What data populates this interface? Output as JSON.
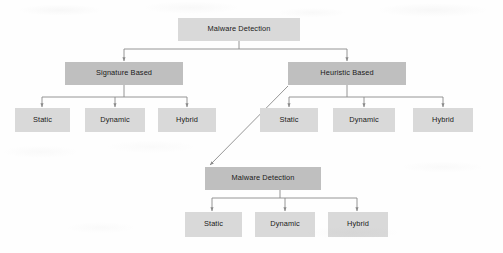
{
  "diagram": {
    "colors": {
      "node_light": "#d9d9d9",
      "node_dark": "#bfbfbf",
      "edge": "#808080",
      "text": "#1a1a1a",
      "background": "#fefefe"
    },
    "nodes": [
      {
        "id": "root",
        "label": "Malware Detection",
        "shade": "light",
        "x": 178,
        "y": 18,
        "w": 122,
        "h": 23
      },
      {
        "id": "signature",
        "label": "Signature Based",
        "shade": "dark",
        "x": 65,
        "y": 62,
        "w": 118,
        "h": 23
      },
      {
        "id": "heuristic",
        "label": "Heuristic Based",
        "shade": "dark",
        "x": 288,
        "y": 62,
        "w": 118,
        "h": 23
      },
      {
        "id": "sig-static",
        "label": "Static",
        "shade": "light",
        "x": 15,
        "y": 108,
        "w": 55,
        "h": 24
      },
      {
        "id": "sig-dynamic",
        "label": "Dynamic",
        "shade": "light",
        "x": 85,
        "y": 108,
        "w": 60,
        "h": 24
      },
      {
        "id": "sig-hybrid",
        "label": "Hybrid",
        "shade": "light",
        "x": 158,
        "y": 108,
        "w": 58,
        "h": 24
      },
      {
        "id": "heu-static",
        "label": "Static",
        "shade": "light",
        "x": 260,
        "y": 108,
        "w": 58,
        "h": 24
      },
      {
        "id": "heu-dynamic",
        "label": "Dynamic",
        "shade": "light",
        "x": 333,
        "y": 108,
        "w": 62,
        "h": 24
      },
      {
        "id": "heu-hybrid",
        "label": "Hybrid",
        "shade": "light",
        "x": 413,
        "y": 108,
        "w": 60,
        "h": 24
      },
      {
        "id": "root2",
        "label": "Malware Detection",
        "shade": "dark",
        "x": 205,
        "y": 167,
        "w": 116,
        "h": 23
      },
      {
        "id": "b-static",
        "label": "Static",
        "shade": "light",
        "x": 185,
        "y": 212,
        "w": 57,
        "h": 25
      },
      {
        "id": "b-dynamic",
        "label": "Dynamic",
        "shade": "light",
        "x": 255,
        "y": 212,
        "w": 60,
        "h": 25
      },
      {
        "id": "b-hybrid",
        "label": "Hybrid",
        "shade": "light",
        "x": 328,
        "y": 212,
        "w": 60,
        "h": 25
      }
    ],
    "edges": [
      {
        "id": "root-to-signature",
        "from": "root",
        "to": "signature",
        "style": "elbow"
      },
      {
        "id": "root-to-heuristic",
        "from": "root",
        "to": "heuristic",
        "style": "elbow"
      },
      {
        "id": "sig-to-static",
        "from": "signature",
        "to": "sig-static",
        "style": "elbow"
      },
      {
        "id": "sig-to-dynamic",
        "from": "signature",
        "to": "sig-dynamic",
        "style": "straight"
      },
      {
        "id": "sig-to-hybrid",
        "from": "signature",
        "to": "sig-hybrid",
        "style": "elbow"
      },
      {
        "id": "heu-to-static",
        "from": "heuristic",
        "to": "heu-static",
        "style": "elbow"
      },
      {
        "id": "heu-to-dynamic",
        "from": "heuristic",
        "to": "heu-dynamic",
        "style": "straight"
      },
      {
        "id": "heu-to-hybrid",
        "from": "heuristic",
        "to": "heu-hybrid",
        "style": "elbow"
      },
      {
        "id": "heu-to-root2",
        "from": "heuristic",
        "to": "root2",
        "style": "diagonal"
      },
      {
        "id": "root2-to-static",
        "from": "root2",
        "to": "b-static",
        "style": "elbow"
      },
      {
        "id": "root2-to-dynamic",
        "from": "root2",
        "to": "b-dynamic",
        "style": "straight"
      },
      {
        "id": "root2-to-hybrid",
        "from": "root2",
        "to": "b-hybrid",
        "style": "elbow"
      }
    ]
  }
}
